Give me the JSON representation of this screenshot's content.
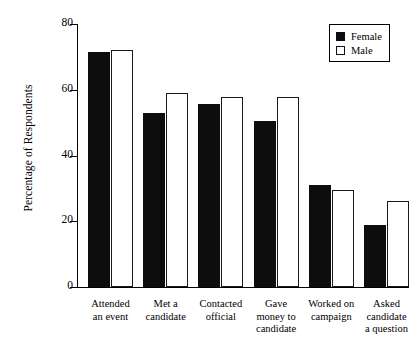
{
  "chart_data": {
    "type": "bar",
    "title": "",
    "xlabel": "",
    "ylabel": "Percentage of Respondents",
    "ylim": [
      0,
      80
    ],
    "yticks": [
      0,
      20,
      40,
      60,
      80
    ],
    "ytick_labels": [
      "0",
      "20",
      "40",
      "60",
      "80"
    ],
    "grid": false,
    "legend_position": "top-right",
    "categories": [
      "Attended an event",
      "Met a candidate",
      "Contacted official",
      "Gave money to candidate",
      "Worked on campaign",
      "Asked candidate a question"
    ],
    "category_lines": [
      [
        "Attended",
        "an event"
      ],
      [
        "Met a",
        "candidate"
      ],
      [
        "Contacted",
        "official"
      ],
      [
        "Gave",
        "money to",
        "candidate"
      ],
      [
        "Worked on",
        "campaign"
      ],
      [
        "Asked",
        "candidate",
        "a question"
      ]
    ],
    "series": [
      {
        "name": "Female",
        "color": "#0d0d0d",
        "values": [
          71.5,
          52.8,
          55.7,
          50.6,
          31.0,
          19.0
        ]
      },
      {
        "name": "Male",
        "color": "#ffffff",
        "values": [
          72.0,
          59.0,
          57.8,
          57.9,
          29.5,
          26.2
        ]
      }
    ]
  },
  "legend": {
    "items": [
      {
        "label": "Female",
        "style": "filled"
      },
      {
        "label": "Male",
        "style": "outline"
      }
    ]
  }
}
